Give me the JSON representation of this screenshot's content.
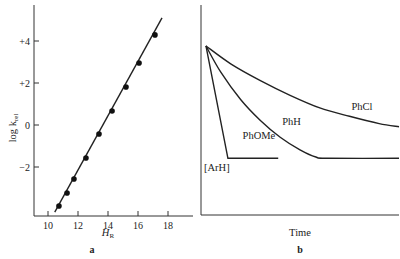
{
  "chart_data": [
    {
      "panel": "a",
      "type": "scatter",
      "panel_label": "a",
      "title": "",
      "xlabel": "H",
      "xlabel_subscript": "R",
      "ylabel": "log k",
      "ylabel_subscript": "rel",
      "xlim": [
        9,
        19.4
      ],
      "ylim": [
        -4.15,
        5.8
      ],
      "xticks": [
        10,
        12,
        14,
        16,
        18
      ],
      "xtick_labels": [
        "10",
        "12",
        "14",
        "16",
        "18"
      ],
      "yticks": [
        4,
        2,
        0,
        -2
      ],
      "ytick_labels": [
        "+4",
        "+2",
        "0",
        "−2"
      ],
      "grid": false,
      "legend": null,
      "points": [
        {
          "x": 10.73,
          "y": -3.86
        },
        {
          "x": 11.27,
          "y": -3.24
        },
        {
          "x": 11.73,
          "y": -2.57
        },
        {
          "x": 12.53,
          "y": -1.57
        },
        {
          "x": 13.4,
          "y": -0.43
        },
        {
          "x": 14.27,
          "y": 0.67
        },
        {
          "x": 15.2,
          "y": 1.81
        },
        {
          "x": 16.07,
          "y": 2.95
        },
        {
          "x": 17.13,
          "y": 4.29
        }
      ],
      "fit_line": {
        "x": [
          10.45,
          17.6
        ],
        "y": [
          -4.15,
          5.1
        ]
      }
    },
    {
      "panel": "b",
      "type": "line",
      "panel_label": "b",
      "title": "",
      "xlabel": "Time",
      "ylabel": "",
      "xlim": [
        0,
        100
      ],
      "ylim": [
        0,
        100
      ],
      "xticks": [],
      "yticks": [],
      "grid": false,
      "legend": null,
      "y_axis_annotation": "[ArH]",
      "series": [
        {
          "name": "PhOMe",
          "x": [
            2.5,
            13.6,
            39
          ],
          "y": [
            80.5,
            27,
            27
          ]
        },
        {
          "name": "PhH",
          "x": [
            2.5,
            10,
            20,
            30,
            40,
            50,
            58,
            64,
            100
          ],
          "y": [
            80.5,
            68,
            55,
            45,
            37,
            31,
            27.6,
            27,
            27
          ]
        },
        {
          "name": "PhCl",
          "x": [
            2.5,
            15,
            30,
            45,
            60,
            75,
            90,
            100
          ],
          "y": [
            80.5,
            72,
            64,
            57,
            51,
            47,
            43.5,
            42
          ]
        }
      ],
      "annotations": [
        {
          "text": "PhOMe",
          "x": 21,
          "y": 36
        },
        {
          "text": "PhH",
          "x": 41,
          "y": 43
        },
        {
          "text": "PhCl",
          "x": 76,
          "y": 50
        }
      ]
    }
  ]
}
